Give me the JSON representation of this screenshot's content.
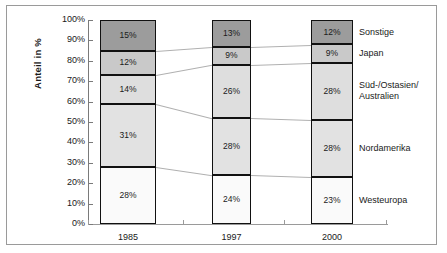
{
  "chart_data": {
    "type": "bar",
    "subtype": "stacked-100-percent",
    "title": "",
    "xlabel": "",
    "ylabel": "Anteil in %",
    "categories": [
      "1985",
      "1997",
      "2000"
    ],
    "ylim": [
      0,
      100
    ],
    "ytick_labels": [
      "0%",
      "10%",
      "20%",
      "30%",
      "40%",
      "50%",
      "60%",
      "70%",
      "80%",
      "90%",
      "100%"
    ],
    "ytick_values": [
      0,
      10,
      20,
      30,
      40,
      50,
      60,
      70,
      80,
      90,
      100
    ],
    "grid": false,
    "legend_position": "right",
    "series": [
      {
        "name": "Westeuropa",
        "values": [
          28,
          24,
          23
        ],
        "labels": [
          "28%",
          "24%",
          "23%"
        ],
        "color": "#fafafa"
      },
      {
        "name": "Nordamerika",
        "values": [
          31,
          28,
          28
        ],
        "labels": [
          "31%",
          "28%",
          "28%"
        ],
        "color": "#e2e2e2"
      },
      {
        "name": "Süd-/Ostasien/\nAustralien",
        "values": [
          14,
          26,
          28
        ],
        "labels": [
          "14%",
          "26%",
          "28%"
        ],
        "color": "#dedede"
      },
      {
        "name": "Japan",
        "values": [
          12,
          9,
          9
        ],
        "labels": [
          "12%",
          "9%",
          "9%"
        ],
        "color": "#c9c9c9"
      },
      {
        "name": "Sonstige",
        "values": [
          15,
          13,
          12
        ],
        "labels": [
          "15%",
          "13%",
          "12%"
        ],
        "color": "#9c9c9c"
      }
    ]
  },
  "axis": {
    "y_label": "Anteil in %",
    "ticks": [
      "100%",
      "90%",
      "80%",
      "70%",
      "60%",
      "50%",
      "40%",
      "30%",
      "20%",
      "10%",
      "0%"
    ]
  },
  "x_categories": [
    {
      "label": "1985"
    },
    {
      "label": "1997"
    },
    {
      "label": "2000"
    }
  ],
  "legend": [
    {
      "label": "Sonstige"
    },
    {
      "label": "Japan"
    },
    {
      "label": "Süd-/Ostasien/\nAustralien"
    },
    {
      "label": "Nordamerika"
    },
    {
      "label": "Westeuropa"
    }
  ],
  "bars": [
    {
      "category": "1985",
      "segments": [
        {
          "name": "Sonstige",
          "label": "15%"
        },
        {
          "name": "Japan",
          "label": "12%"
        },
        {
          "name": "Süd-/Ostasien/Australien",
          "label": "14%"
        },
        {
          "name": "Nordamerika",
          "label": "31%"
        },
        {
          "name": "Westeuropa",
          "label": "28%"
        }
      ]
    },
    {
      "category": "1997",
      "segments": [
        {
          "name": "Sonstige",
          "label": "13%"
        },
        {
          "name": "Japan",
          "label": "9%"
        },
        {
          "name": "Süd-/Ostasien/Australien",
          "label": "26%"
        },
        {
          "name": "Nordamerika",
          "label": "28%"
        },
        {
          "name": "Westeuropa",
          "label": "24%"
        }
      ]
    },
    {
      "category": "2000",
      "segments": [
        {
          "name": "Sonstige",
          "label": "12%"
        },
        {
          "name": "Japan",
          "label": "9%"
        },
        {
          "name": "Süd-/Ostasien/Australien",
          "label": "28%"
        },
        {
          "name": "Nordamerika",
          "label": "28%"
        },
        {
          "name": "Westeuropa",
          "label": "23%"
        }
      ]
    }
  ]
}
